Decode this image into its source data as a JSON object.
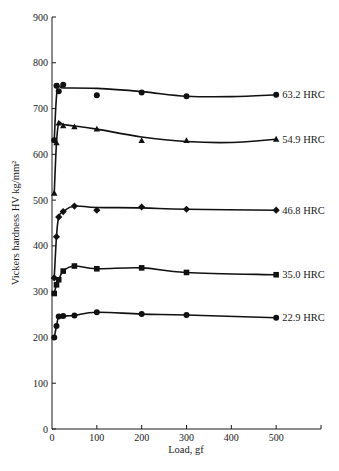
{
  "chart_data": {
    "type": "line",
    "title": "",
    "xlabel": "Load, gf",
    "ylabel": "Vickers hardness HV kg/mm²",
    "xlim": [
      0,
      600
    ],
    "ylim": [
      0,
      900
    ],
    "xticks": [
      0,
      100,
      200,
      300,
      400,
      500
    ],
    "yticks": [
      0,
      100,
      200,
      300,
      400,
      500,
      600,
      700,
      800,
      900
    ],
    "grid": false,
    "legend_position": "inline-right",
    "series": [
      {
        "name": "63.2 HRC",
        "marker": "circle",
        "x": [
          5,
          10,
          15,
          25,
          100,
          200,
          300,
          500
        ],
        "values": [
          631,
          750,
          738,
          752,
          729,
          735,
          727,
          730
        ],
        "curve": [
          [
            5,
            631
          ],
          [
            12,
            745
          ],
          [
            25,
            745
          ],
          [
            100,
            744
          ],
          [
            200,
            737
          ],
          [
            300,
            727
          ],
          [
            400,
            726
          ],
          [
            500,
            730
          ]
        ]
      },
      {
        "name": "54.9 HRC",
        "marker": "triangle",
        "x": [
          5,
          10,
          15,
          25,
          50,
          100,
          200,
          300,
          500
        ],
        "values": [
          515,
          625,
          668,
          662,
          660,
          655,
          630,
          630,
          633
        ],
        "curve": [
          [
            5,
            515
          ],
          [
            10,
            625
          ],
          [
            15,
            668
          ],
          [
            25,
            665
          ],
          [
            50,
            662
          ],
          [
            100,
            655
          ],
          [
            200,
            638
          ],
          [
            300,
            628
          ],
          [
            400,
            626
          ],
          [
            500,
            633
          ]
        ]
      },
      {
        "name": "46.8 HRC",
        "marker": "diamond",
        "x": [
          5,
          10,
          15,
          25,
          50,
          100,
          200,
          300,
          500
        ],
        "values": [
          330,
          420,
          463,
          475,
          487,
          478,
          485,
          480,
          478
        ],
        "curve": [
          [
            5,
            330
          ],
          [
            10,
            420
          ],
          [
            15,
            463
          ],
          [
            25,
            475
          ],
          [
            50,
            487
          ],
          [
            100,
            484
          ],
          [
            200,
            483
          ],
          [
            300,
            480
          ],
          [
            500,
            478
          ]
        ]
      },
      {
        "name": "35.0 HRC",
        "marker": "square",
        "x": [
          5,
          10,
          15,
          25,
          50,
          100,
          200,
          300,
          500
        ],
        "values": [
          296,
          315,
          326,
          345,
          356,
          350,
          352,
          342,
          337
        ],
        "curve": [
          [
            5,
            296
          ],
          [
            10,
            315
          ],
          [
            15,
            326
          ],
          [
            25,
            345
          ],
          [
            50,
            356
          ],
          [
            100,
            350
          ],
          [
            200,
            352
          ],
          [
            300,
            342
          ],
          [
            500,
            337
          ]
        ]
      },
      {
        "name": "22.9 HRC",
        "marker": "circle",
        "x": [
          5,
          10,
          15,
          25,
          50,
          100,
          200,
          300,
          500
        ],
        "values": [
          200,
          225,
          246,
          247,
          248,
          255,
          251,
          249,
          243
        ],
        "curve": [
          [
            5,
            200
          ],
          [
            10,
            225
          ],
          [
            15,
            246
          ],
          [
            25,
            247
          ],
          [
            50,
            248
          ],
          [
            100,
            255
          ],
          [
            200,
            251
          ],
          [
            300,
            249
          ],
          [
            500,
            243
          ]
        ]
      }
    ]
  }
}
